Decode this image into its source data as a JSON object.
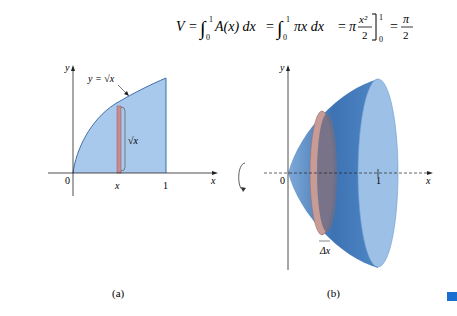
{
  "equation": {
    "lhs": "V",
    "int1_lower": "0",
    "int1_upper": "1",
    "int1_body": "A(x) dx",
    "int2_lower": "0",
    "int2_upper": "1",
    "int2_body": "πx dx",
    "rhs_coeff": "π",
    "rhs_num": "x²",
    "rhs_den": "2",
    "eval_upper": "1",
    "eval_lower": "0",
    "result_num": "π",
    "result_den": "2"
  },
  "figure_a": {
    "caption": "(a)",
    "y_label": "y",
    "x_label": "x",
    "origin_label": "0",
    "x_tick_label": "x",
    "one_label": "1",
    "curve_label": "y = √x",
    "height_label": "√x"
  },
  "figure_b": {
    "caption": "(b)",
    "y_label": "y",
    "x_label": "x",
    "origin_label": "0",
    "one_label": "1",
    "thickness_label": "Δx"
  },
  "colors": {
    "region_fill": "#a9c9ec",
    "curve": "#3f6fa8",
    "strip": "#c98b8b",
    "solid_dark": "#3d73b3",
    "solid_light": "#9dc1e6",
    "disk_rim": "#c79c97",
    "disk_face": "#6f6f86",
    "marker": "#1a6fd0"
  }
}
